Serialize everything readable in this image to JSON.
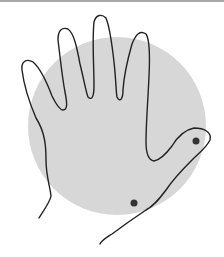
{
  "diagram": {
    "title": "Hand outline over circle with two marked points",
    "colors": {
      "background": "#ffffff",
      "top_border": "#a8a8a8",
      "circle_fill": "#d7d7d7",
      "outline": "#222222",
      "dot": "#333333"
    },
    "circle": {
      "cx": 117,
      "cy": 126,
      "r": 89
    },
    "hand_path": "M39 218 C44 210 50 202 51 196 C50 186 46 176 46 160 C46 146 45 132 36 118 C30 104 24 86 22 70 C21 62 26 58 33 62 C40 68 46 80 52 96 C56 104 60 110 63 110 C68 110 67 102 65 92 C62 76 60 56 58 40 C58 30 62 27 68 29 C74 33 77 48 80 64 C84 80 86 92 88 97 C92 101 94 96 94 86 C94 66 92 40 94 22 C96 14 102 14 106 18 C110 28 112 44 114 62 C116 80 116 92 117 97 C120 103 123 99 123 90 C124 74 128 58 132 44 C136 34 140 30 146 34 C150 40 150 56 149 76 C148 100 146 124 146 142 C146 152 148 160 154 161 C160 160 166 154 172 146 C178 136 184 130 194 128 C204 128 212 132 210 140 C206 148 200 152 192 160 C182 170 174 178 166 190 C160 198 154 206 146 210 C134 218 120 228 112 234 C106 238 102 240 100 244",
    "dots": [
      {
        "name": "thumb-tip-point",
        "cx": 196,
        "cy": 141,
        "r": 3.5
      },
      {
        "name": "wrist-point",
        "cx": 134,
        "cy": 203,
        "r": 3.5
      }
    ]
  }
}
